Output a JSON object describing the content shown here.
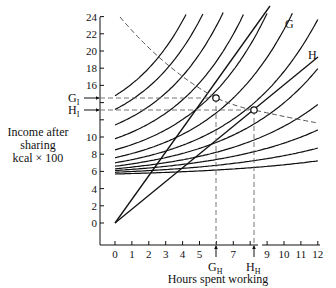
{
  "chart_data": {
    "type": "line",
    "title": "",
    "xlabel": "Hours spent working",
    "ylabel": "Income after sharing kcal × 100",
    "ylabel_lines": [
      "Income after",
      "sharing",
      "kcal × 100"
    ],
    "xlim": [
      0,
      12
    ],
    "ylim": [
      0,
      24
    ],
    "x_ticks": [
      "0",
      "1",
      "2",
      "3",
      "4",
      "5",
      "",
      "7",
      "",
      "9",
      "10",
      "11",
      "12"
    ],
    "y_ticks": [
      "0",
      "2",
      "4",
      "6",
      "8",
      "10",
      "",
      "",
      "16",
      "18",
      "20",
      "22",
      "24"
    ],
    "grid": false,
    "series": [
      {
        "name": "G",
        "kind": "budget line",
        "x": [
          0,
          12
        ],
        "y": [
          0,
          26.5
        ]
      },
      {
        "name": "H",
        "kind": "budget line",
        "x": [
          0,
          12
        ],
        "y": [
          0,
          19.5
        ]
      },
      {
        "name": "indifference curves",
        "kind": "family",
        "count": 12,
        "start_y_range": [
          5.7,
          14
        ]
      },
      {
        "name": "optimum locus",
        "kind": "dashed curve",
        "x": [
          1.4,
          3.5,
          6,
          8.2,
          12
        ],
        "y": [
          24,
          19,
          14.5,
          12.4,
          11
        ]
      }
    ],
    "annotations": [
      {
        "label": "G",
        "sub": "I",
        "axis": "y",
        "value": 14.5
      },
      {
        "label": "H",
        "sub": "I",
        "axis": "y",
        "value": 12.4
      },
      {
        "label": "G",
        "sub": "H",
        "axis": "x",
        "value": 6
      },
      {
        "label": "H",
        "sub": "H",
        "axis": "x",
        "value": 8.2
      },
      {
        "label": "G",
        "at": "end of line G"
      },
      {
        "label": "H",
        "at": "end of line H"
      }
    ]
  },
  "labels": {
    "ylabel1": "Income after",
    "ylabel2": "sharing",
    "ylabel3": "kcal × 100",
    "xlabel": "Hours spent working",
    "GI": "G",
    "GI_sub": "I",
    "HI": "H",
    "HI_sub": "I",
    "GH": "G",
    "GH_sub": "H",
    "HH": "H",
    "HH_sub": "H",
    "lineG": "G",
    "lineH": "H"
  }
}
